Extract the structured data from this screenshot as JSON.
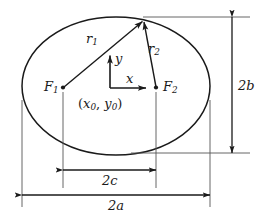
{
  "figure": {
    "background_color": "#ffffff",
    "stroke_color": "#1a1a1a",
    "labels": {
      "focus_1": "F",
      "focus_1_sub": "1",
      "focus_2": "F",
      "focus_2_sub": "2",
      "radius_1": "r",
      "radius_1_sub": "1",
      "radius_2": "r",
      "radius_2_sub": "2",
      "axis_x": "x",
      "axis_y": "y",
      "center_open_paren": "(",
      "center_x": "x",
      "center_x_sub": "0",
      "center_comma": ",",
      "center_y": "y",
      "center_y_sub": "0",
      "center_close_paren": ")",
      "dim_minor": "2b",
      "dim_focal": "2c",
      "dim_major": "2a"
    },
    "geometry": {
      "center_x": 116,
      "center_y": 86,
      "semi_major_px": 94,
      "semi_minor_px": 68,
      "focus_1_x": 63,
      "focus_2_x": 156,
      "focus_y": 88,
      "point_on_ellipse_x": 143,
      "point_on_ellipse_y": 20,
      "origin_x": 110,
      "origin_y": 88
    }
  }
}
